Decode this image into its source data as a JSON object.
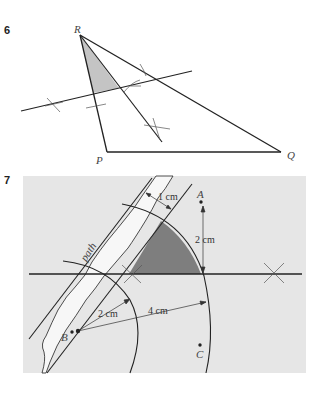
{
  "questions": [
    {
      "number": "6",
      "figure": {
        "type": "triangle-construction",
        "vertices": {
          "R": "R",
          "P": "P",
          "Q": "Q"
        },
        "shaded_region_color": "#c4c4c4",
        "line_color": "#222222"
      }
    },
    {
      "number": "7",
      "figure": {
        "type": "loci-construction",
        "background_color": "#e6e6e6",
        "path_color": "#f7f7f7",
        "shaded_region_color": "#7e7e7e",
        "labels": {
          "path": "path",
          "point_a": "A",
          "point_b": "B",
          "point_c": "C",
          "dist_1cm": "1 cm",
          "dist_2cm_vertical": "2 cm",
          "dist_2cm_radius": "2 cm",
          "dist_4cm_radius": "4 cm"
        }
      }
    }
  ]
}
